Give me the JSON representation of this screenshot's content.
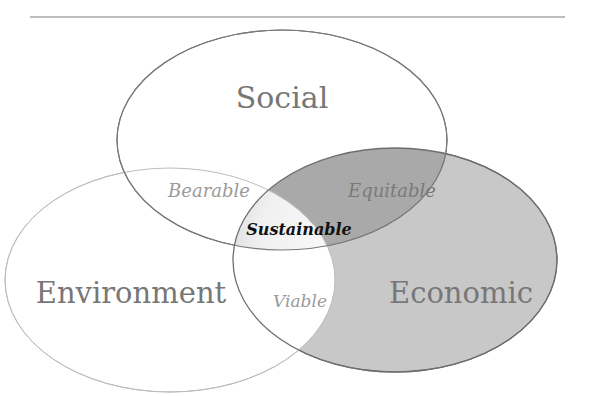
{
  "diagram": {
    "type": "venn",
    "circles": [
      {
        "id": "social",
        "label": "Social",
        "fill": "#ffffff",
        "stroke": "#6e6e6e"
      },
      {
        "id": "environment",
        "label": "Environment",
        "fill": "#ffffff",
        "stroke": "#bdbdbd"
      },
      {
        "id": "economic",
        "label": "Economic",
        "fill": "#c8c8c8",
        "stroke": "#6e6e6e"
      }
    ],
    "intersections": {
      "social_environment": "Bearable",
      "social_economic": "Equitable",
      "environment_economic": "Viable",
      "all": "Sustainable"
    },
    "colors": {
      "economic_fill": "#c8c8c8",
      "equitable_fill": "#a9a9a9",
      "main_label": "#777777",
      "intersection_label": "#9a9a9a",
      "center_label": "#111111",
      "rule_line": "#7a7a7a"
    }
  }
}
